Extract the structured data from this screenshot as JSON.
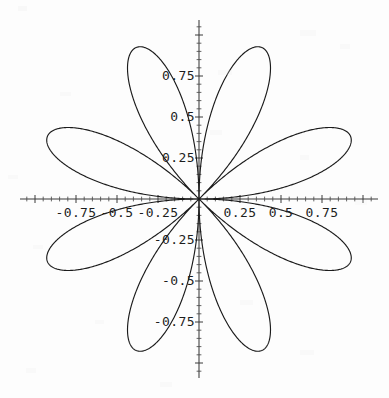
{
  "figure": {
    "kind": "polar-rose-plot",
    "background_color": "#fdfdfd",
    "curve_color": "#1b1b1b",
    "axis_color": "#3a3a3a",
    "origin_px": [
      199,
      199
    ],
    "unit_px": 164
  },
  "axes": {
    "x_axis": {
      "name": "horizontal-axis",
      "y_px": 199,
      "x_start_px": 20,
      "x_end_px": 378
    },
    "y_axis": {
      "name": "vertical-axis",
      "x_px": 199,
      "y_start_px": 20,
      "y_end_px": 378
    }
  },
  "x_labels": [
    {
      "text": "-0.75",
      "value": -0.75
    },
    {
      "text": "-0.5",
      "value": -0.5
    },
    {
      "text": "-0.25",
      "value": -0.25
    },
    {
      "text": "0.25",
      "value": 0.25
    },
    {
      "text": "0.5",
      "value": 0.5
    },
    {
      "text": "0.75",
      "value": 0.75
    }
  ],
  "y_labels": [
    {
      "text": "0.75",
      "value": 0.75
    },
    {
      "text": "0.5",
      "value": 0.5
    },
    {
      "text": "0.25",
      "value": 0.25
    },
    {
      "text": "-0.25",
      "value": -0.25
    },
    {
      "text": "-0.5",
      "value": -0.5
    },
    {
      "text": "-0.75",
      "value": -0.75
    }
  ],
  "chart_data": {
    "type": "line",
    "subtype": "polar-rose",
    "title": "",
    "xlabel": "",
    "ylabel": "",
    "xlim": [
      -1.09,
      1.09
    ],
    "ylim": [
      -1.09,
      1.09
    ],
    "grid": false,
    "legend": null,
    "equation": "r = cos(4*theta), plotted as x = r*cos(theta+pi/8), y = r*sin(theta+pi/8)",
    "petal_count": 8,
    "petal_max_radius": 1.0,
    "petal_tip_angles_deg": [
      22.5,
      67.5,
      112.5,
      157.5,
      202.5,
      247.5,
      292.5,
      337.5
    ],
    "x_ticks": [
      -0.75,
      -0.5,
      -0.25,
      0.25,
      0.5,
      0.75
    ],
    "y_ticks": [
      -0.75,
      -0.5,
      -0.25,
      0.25,
      0.5,
      0.75
    ],
    "x_tick_labels": [
      "-0.75",
      "-0.5",
      "-0.25",
      "0.25",
      "0.5",
      "0.75"
    ],
    "y_tick_labels": [
      "-0.75",
      "-0.5",
      "-0.25",
      "0.25",
      "0.5",
      "0.75"
    ],
    "minor_tick_step": 0.05,
    "series": [
      {
        "name": "rose",
        "color": "#1b1b1b",
        "petal_tips": [
          {
            "angle_deg": 22.5,
            "x": 0.924,
            "y": 0.383
          },
          {
            "angle_deg": 67.5,
            "x": 0.383,
            "y": 0.924
          },
          {
            "angle_deg": 112.5,
            "x": -0.383,
            "y": 0.924
          },
          {
            "angle_deg": 157.5,
            "x": -0.924,
            "y": 0.383
          },
          {
            "angle_deg": 202.5,
            "x": -0.924,
            "y": -0.383
          },
          {
            "angle_deg": 247.5,
            "x": -0.383,
            "y": -0.924
          },
          {
            "angle_deg": 292.5,
            "x": 0.383,
            "y": -0.924
          },
          {
            "angle_deg": 337.5,
            "x": 0.924,
            "y": -0.383
          }
        ]
      }
    ]
  }
}
